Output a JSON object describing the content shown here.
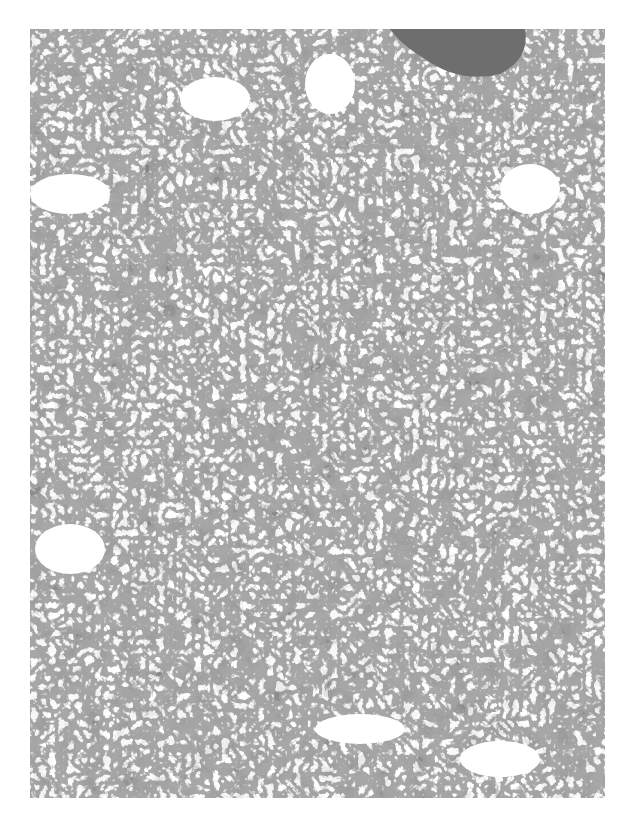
{
  "image": {
    "type": "histology-micrograph",
    "stain": "grayscale",
    "description": "Tissue section with densely packed cells, dark nuclei, and numerous clear vacuolated spaces; a dark homogeneous vessel lumen at top right",
    "colors": {
      "background": "#ffffff",
      "tissue_light": "#e6e6e6",
      "stroma": "#b5b5b5",
      "nuclei": "#2a2a2a",
      "vessel_content": "#6e6e6e"
    },
    "bounds": {
      "left": 30,
      "top": 29,
      "width": 575,
      "height": 769
    }
  }
}
